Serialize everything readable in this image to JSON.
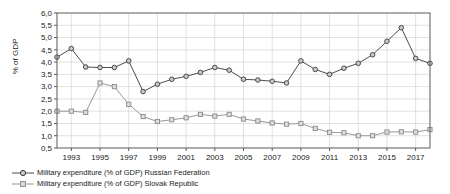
{
  "chart_data": {
    "type": "line",
    "title": "",
    "xlabel": "",
    "ylabel": "% of GDP",
    "ylim": [
      0.5,
      6.0
    ],
    "ytick_step": 0.5,
    "yticks": [
      "0,5",
      "1,0",
      "1,5",
      "2,0",
      "2,5",
      "3,0",
      "3,5",
      "4,0",
      "4,5",
      "5,0",
      "5,5",
      "6,0"
    ],
    "xlim": [
      1992,
      2018
    ],
    "xticks": [
      "1993",
      "1995",
      "1997",
      "1999",
      "2001",
      "2003",
      "2005",
      "2007",
      "2009",
      "2011",
      "2013",
      "2015",
      "2017"
    ],
    "x": [
      1992,
      1993,
      1994,
      1995,
      1996,
      1997,
      1998,
      1999,
      2000,
      2001,
      2002,
      2003,
      2004,
      2005,
      2006,
      2007,
      2008,
      2009,
      2010,
      2011,
      2012,
      2013,
      2014,
      2015,
      2016,
      2017,
      2018
    ],
    "grid": true,
    "legend_position": "below",
    "series": [
      {
        "name": "Military expenditure (% of GDP) Russian Federation",
        "marker": "circle",
        "color": "#4d4d4d",
        "values": [
          4.2,
          4.55,
          3.8,
          3.78,
          3.78,
          4.05,
          2.8,
          3.1,
          3.3,
          3.42,
          3.58,
          3.78,
          3.67,
          3.3,
          3.27,
          3.22,
          3.15,
          4.05,
          3.7,
          3.5,
          3.75,
          3.95,
          4.3,
          4.85,
          5.4,
          4.15,
          3.95
        ]
      },
      {
        "name": "Military expenditure (% of GDP) Slovak Republic",
        "marker": "square",
        "color": "#999999",
        "values": [
          2.0,
          2.0,
          1.95,
          3.15,
          3.0,
          2.28,
          1.78,
          1.58,
          1.65,
          1.73,
          1.87,
          1.8,
          1.87,
          1.68,
          1.6,
          1.52,
          1.47,
          1.5,
          1.3,
          1.14,
          1.12,
          1.0,
          1.0,
          1.15,
          1.16,
          1.15,
          1.25
        ]
      }
    ]
  },
  "legend": {
    "items": [
      {
        "label": "Military expenditure (% of GDP) Russian Federation"
      },
      {
        "label": "Military expenditure (% of GDP) Slovak Republic"
      }
    ]
  },
  "axes": {
    "y_title": "% of GDP"
  }
}
